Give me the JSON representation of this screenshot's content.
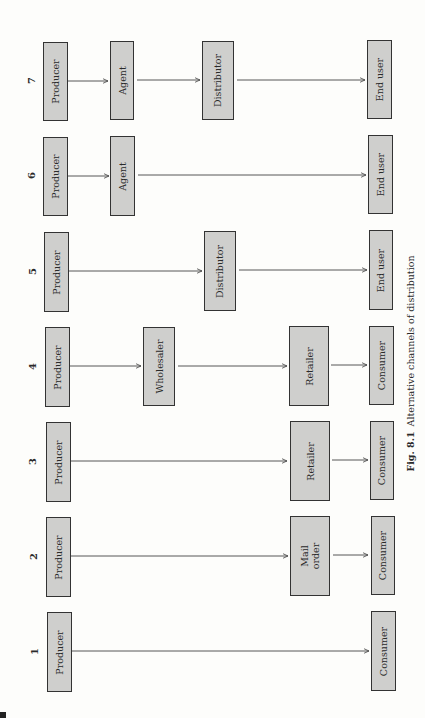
{
  "figure": {
    "number_label": "Fig. 8.1",
    "title": "Alternative channels of distribution",
    "orientation": "rotated 90° counter-clockwise"
  },
  "colors": {
    "box_fill": "#cfcfcd",
    "box_border": "#333333",
    "arrow": "#444444",
    "background": "#fdfdfb"
  },
  "channels": [
    {
      "number": "1",
      "nodes": [
        "Producer",
        "Consumer"
      ]
    },
    {
      "number": "2",
      "nodes": [
        "Producer",
        "Mail order",
        "Consumer"
      ]
    },
    {
      "number": "3",
      "nodes": [
        "Producer",
        "Retailer",
        "Consumer"
      ]
    },
    {
      "number": "4",
      "nodes": [
        "Producer",
        "Wholesaler",
        "Retailer",
        "Consumer"
      ]
    },
    {
      "number": "5",
      "nodes": [
        "Producer",
        "Distributor",
        "End user"
      ]
    },
    {
      "number": "6",
      "nodes": [
        "Producer",
        "Agent",
        "End user"
      ]
    },
    {
      "number": "7",
      "nodes": [
        "Producer",
        "Agent",
        "Distributor",
        "End user"
      ]
    }
  ]
}
